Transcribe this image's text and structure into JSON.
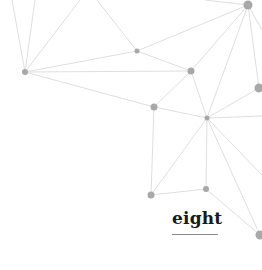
{
  "caption": {
    "text": "eight"
  },
  "colors": {
    "node": "#a8a8a8",
    "edge": "#d6d6d6",
    "text": "#1a1a1a"
  },
  "network": {
    "nodes": [
      {
        "x": 248,
        "y": 5,
        "r": 4.5
      },
      {
        "x": 137,
        "y": 51,
        "r": 2.5
      },
      {
        "x": 25,
        "y": 72,
        "r": 3
      },
      {
        "x": 191,
        "y": 71,
        "r": 3.5
      },
      {
        "x": 259,
        "y": 88,
        "r": 4.5
      },
      {
        "x": 154,
        "y": 107,
        "r": 3.5
      },
      {
        "x": 207,
        "y": 118,
        "r": 2.5
      },
      {
        "x": 151,
        "y": 195,
        "r": 3.5
      },
      {
        "x": 206,
        "y": 189,
        "r": 3
      },
      {
        "x": 260,
        "y": 235,
        "r": 4.5
      }
    ]
  }
}
